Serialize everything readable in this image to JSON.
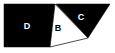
{
  "figure": {
    "width": 115,
    "height": 53,
    "background_color": "#ffffff",
    "fill_color": "#000000",
    "label_on_dark_color": "#ffffff",
    "label_on_light_color": "#000000",
    "regions": [
      {
        "id": "region-d",
        "label": "D",
        "shading": "filled",
        "fill": "#000000",
        "label_color": "#ffffff",
        "label_x": 27,
        "label_y": 27,
        "points": "4,4 55,4 50,47 4,47"
      },
      {
        "id": "region-b",
        "label": "B",
        "shading": "unfilled",
        "fill": "#ffffff",
        "label_color": "#000000",
        "label_x": 58,
        "label_y": 29,
        "points": "55,4 88,38 50,47"
      },
      {
        "id": "region-c",
        "label": "C",
        "shading": "filled",
        "fill": "#000000",
        "label_color": "#ffffff",
        "label_x": 81,
        "label_y": 18,
        "points": "56,4 110,4 88,38"
      }
    ],
    "labels": [
      "D",
      "B",
      "C"
    ]
  }
}
